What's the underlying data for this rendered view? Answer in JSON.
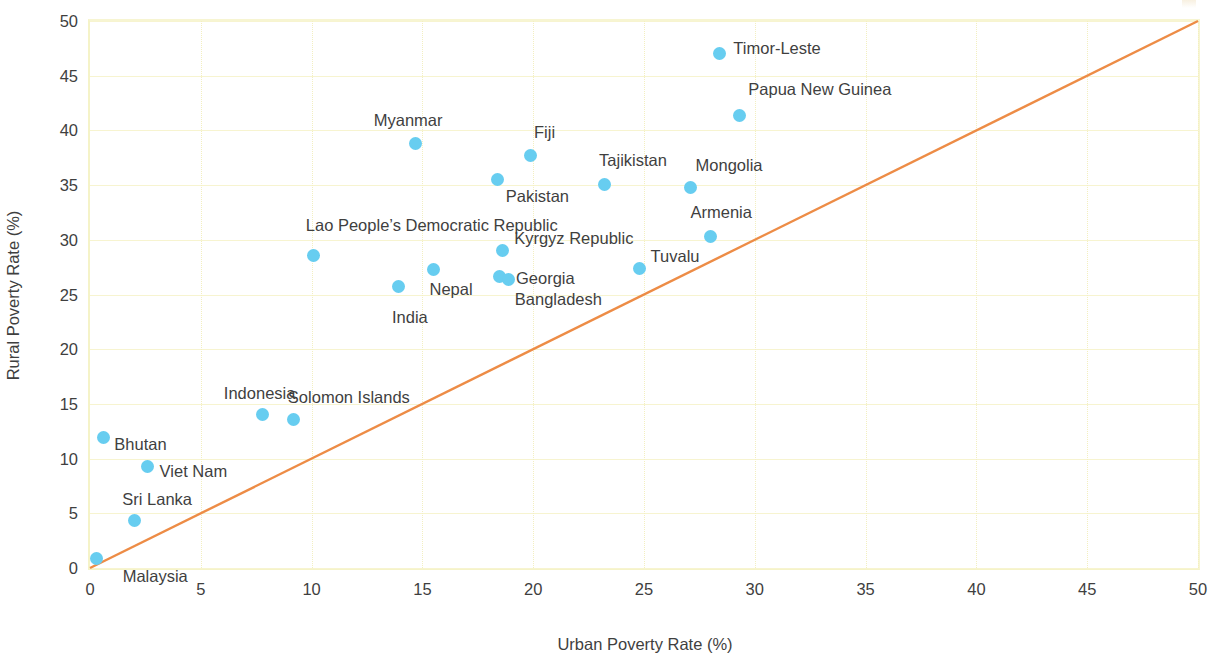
{
  "chart_data": {
    "type": "scatter",
    "title": "",
    "xlabel": "Urban Poverty Rate (%)",
    "ylabel": "Rural Poverty Rate (%)",
    "xlim": [
      0,
      50
    ],
    "ylim": [
      0,
      50
    ],
    "xticks": [
      "0",
      "5",
      "10",
      "15",
      "20",
      "25",
      "30",
      "35",
      "40",
      "45",
      "50"
    ],
    "yticks": [
      "0",
      "5",
      "10",
      "15",
      "20",
      "25",
      "30",
      "35",
      "40",
      "45",
      "50"
    ],
    "xtick_values": [
      0,
      5,
      10,
      15,
      20,
      25,
      30,
      35,
      40,
      45,
      50
    ],
    "ytick_values": [
      0,
      5,
      10,
      15,
      20,
      25,
      30,
      35,
      40,
      45,
      50
    ],
    "grid": true,
    "legend": "none",
    "marker_color": "#67cdf0",
    "gridline_color": "#f7f4d0",
    "reference_line": {
      "name": "45-degree parity line",
      "color": "#ed8c46",
      "from": [
        0,
        0
      ],
      "to": [
        50,
        50
      ]
    },
    "points": [
      {
        "label": "Timor-Leste",
        "x": 28.4,
        "y": 47.0,
        "label_dx": 14,
        "label_dy": -6
      },
      {
        "label": "Papua New Guinea",
        "x": 29.3,
        "y": 41.4,
        "label_dx": 9,
        "label_dy": -26
      },
      {
        "label": "Myanmar",
        "x": 14.7,
        "y": 38.8,
        "label_dx": -42,
        "label_dy": -24
      },
      {
        "label": "Fiji",
        "x": 19.9,
        "y": 37.7,
        "label_dx": 3,
        "label_dy": -24
      },
      {
        "label": "Pakistan",
        "x": 18.4,
        "y": 35.5,
        "label_dx": 8,
        "label_dy": 16
      },
      {
        "label": "Tajikistan",
        "x": 23.2,
        "y": 35.1,
        "label_dx": -5,
        "label_dy": -24
      },
      {
        "label": "Mongolia",
        "x": 27.1,
        "y": 34.8,
        "label_dx": 5,
        "label_dy": -22
      },
      {
        "label": "Armenia",
        "x": 28.0,
        "y": 30.3,
        "label_dx": -20,
        "label_dy": -25
      },
      {
        "label": "Kyrgyz Republic",
        "x": 18.6,
        "y": 29.0,
        "label_dx": 12,
        "label_dy": -13
      },
      {
        "label": "Lao People’s Democratic Republic",
        "x": 10.1,
        "y": 28.6,
        "label_dx": -8,
        "label_dy": -30
      },
      {
        "label": "Tuvalu",
        "x": 24.8,
        "y": 27.4,
        "label_dx": 11,
        "label_dy": -12
      },
      {
        "label": "Nepal",
        "x": 15.5,
        "y": 27.3,
        "label_dx": -4,
        "label_dy": 20
      },
      {
        "label": "Georgia",
        "x": 18.5,
        "y": 26.6,
        "label_dx": 16,
        "label_dy": 1
      },
      {
        "label": "Bangladesh",
        "x": 18.9,
        "y": 26.4,
        "label_dx": 6,
        "label_dy": 20
      },
      {
        "label": "India",
        "x": 13.9,
        "y": 25.7,
        "label_dx": -6,
        "label_dy": 30
      },
      {
        "label": "Indonesia",
        "x": 7.8,
        "y": 14.0,
        "label_dx": -39,
        "label_dy": -22
      },
      {
        "label": "Solomon Islands",
        "x": 9.2,
        "y": 13.6,
        "label_dx": -6,
        "label_dy": -22
      },
      {
        "label": "Bhutan",
        "x": 0.6,
        "y": 11.9,
        "label_dx": 11,
        "label_dy": 6
      },
      {
        "label": "Viet Nam",
        "x": 2.6,
        "y": 9.3,
        "label_dx": 12,
        "label_dy": 5
      },
      {
        "label": "Sri Lanka",
        "x": 2.0,
        "y": 4.3,
        "label_dx": -12,
        "label_dy": -22
      },
      {
        "label": "Malaysia",
        "x": 0.3,
        "y": 0.9,
        "label_dx": 26,
        "label_dy": 18
      }
    ]
  }
}
